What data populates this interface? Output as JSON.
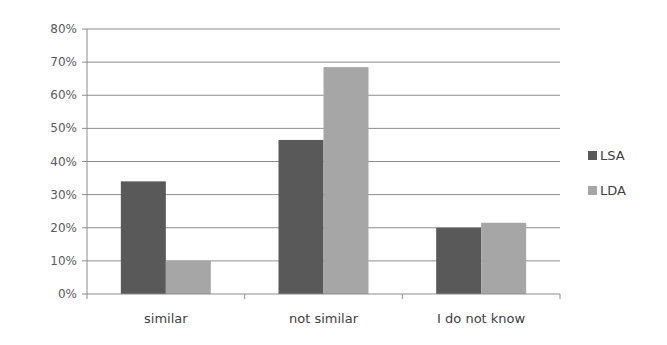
{
  "chart_data": {
    "type": "bar",
    "title": "",
    "xlabel": "",
    "ylabel": "",
    "categories": [
      "similar",
      "not similar",
      "I do not know"
    ],
    "series": [
      {
        "name": "LSA",
        "color": "#595959",
        "values": [
          34,
          46.5,
          20
        ]
      },
      {
        "name": "LDA",
        "color": "#a6a6a6",
        "values": [
          10,
          68.5,
          21.5
        ]
      }
    ],
    "ylim": [
      0,
      80
    ],
    "yticks": [
      0,
      10,
      20,
      30,
      40,
      50,
      60,
      70,
      80
    ],
    "ytick_labels": [
      "0%",
      "10%",
      "20%",
      "30%",
      "40%",
      "50%",
      "60%",
      "70%",
      "80%"
    ],
    "grid": true,
    "legend_position": "right"
  }
}
